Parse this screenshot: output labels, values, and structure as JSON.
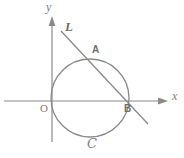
{
  "figure": {
    "kind": "geometry-diagram",
    "width": 184,
    "height": 158,
    "background_color": "#ffffff",
    "stroke_color": "#8a8a8a",
    "label_color": "#7d7d7d"
  },
  "axes": {
    "x_label": "x",
    "y_label": "y",
    "origin_label": "O",
    "origin_px": {
      "x": 52,
      "y": 101
    },
    "x_axis": {
      "x1": 4,
      "y1": 101,
      "x2": 168,
      "y2": 101,
      "arrow": "right"
    },
    "y_axis": {
      "x1": 52,
      "y1": 140,
      "x2": 52,
      "y2": 16,
      "arrow": "up"
    }
  },
  "circle": {
    "label": "ɔ",
    "display_label": "C",
    "center_px": {
      "x": 90,
      "y": 98
    },
    "radius_px": 39,
    "note": "tangent to y-axis at origin"
  },
  "line": {
    "label": "L",
    "start_px": {
      "x": 61,
      "y": 31
    },
    "end_px": {
      "x": 148,
      "y": 124
    }
  },
  "points": [
    {
      "name": "A",
      "label": "A",
      "x": 99,
      "y": 65,
      "label_x": 92,
      "label_y": 46
    },
    {
      "name": "B",
      "label": "B",
      "x": 127,
      "y": 101,
      "label_x": 124,
      "label_y": 104
    }
  ],
  "labels": {
    "y_axis_label_pos": {
      "x": 48,
      "y": 2
    },
    "x_axis_label_pos": {
      "x": 172,
      "y": 92
    },
    "line_label_pos": {
      "x": 66,
      "y": 22
    },
    "origin_label_pos": {
      "x": 40,
      "y": 104
    },
    "curve_label_pos": {
      "x": 88,
      "y": 140
    }
  }
}
